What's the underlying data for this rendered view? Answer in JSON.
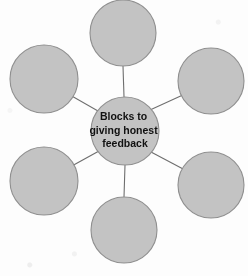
{
  "diagram": {
    "type": "spider-web-concept-map",
    "background_color": "#fdfdfd",
    "node_fill": "#c3c3c3",
    "node_stroke": "#8f8f8f",
    "connector_color": "#6e6e6e",
    "center": {
      "label_lines": [
        "Blocks to",
        "giving honest",
        "feedback"
      ],
      "full_label": "Blocks to giving honest feedback",
      "cx": 125,
      "cy": 131,
      "r": 34
    },
    "satellites": [
      {
        "id": "top",
        "label": "",
        "cx": 123,
        "cy": 33,
        "r": 33
      },
      {
        "id": "upper-right",
        "label": "",
        "cx": 211,
        "cy": 81,
        "r": 33
      },
      {
        "id": "lower-right",
        "label": "",
        "cx": 211,
        "cy": 185,
        "r": 33
      },
      {
        "id": "bottom",
        "label": "",
        "cx": 124,
        "cy": 230,
        "r": 33
      },
      {
        "id": "lower-left",
        "label": "",
        "cx": 44,
        "cy": 181,
        "r": 34
      },
      {
        "id": "upper-left",
        "label": "",
        "cx": 44,
        "cy": 79,
        "r": 34
      }
    ],
    "connectors": [
      {
        "from": "center",
        "to": "top"
      },
      {
        "from": "center",
        "to": "upper-right"
      },
      {
        "from": "center",
        "to": "lower-right"
      },
      {
        "from": "center",
        "to": "bottom"
      },
      {
        "from": "center",
        "to": "lower-left"
      },
      {
        "from": "center",
        "to": "upper-left"
      }
    ]
  }
}
